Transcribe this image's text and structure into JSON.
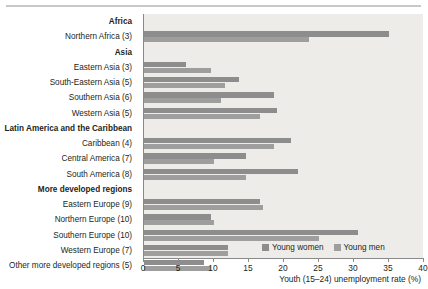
{
  "chart_data": {
    "type": "bar",
    "orientation": "horizontal",
    "title": "",
    "xlabel": "Youth (15–24) unemployment rate (%)",
    "ylabel": "",
    "xlim": [
      0,
      40
    ],
    "xticks": [
      0,
      5,
      10,
      15,
      20,
      25,
      30,
      35,
      40
    ],
    "grid": false,
    "legend_position": "bottom-right",
    "legend": [
      "Young women",
      "Young men"
    ],
    "colors": {
      "young_women": "#8d8d8d",
      "young_men": "#9e9e9e",
      "plot_background": "#eeece8",
      "axis": "#8a8a8a",
      "text": "#231f20"
    },
    "categories": [
      "Africa",
      "Northern Africa (3)",
      "Asia",
      "Eastern Asia (3)",
      "South-Eastern Asia (5)",
      "Southern Asia (6)",
      "Western Asia (5)",
      "Latin America and the Caribbean",
      "Caribbean (4)",
      "Central America (7)",
      "South America (8)",
      "More developed regions",
      "Eastern Europe (9)",
      "Northern Europe (10)",
      "Southern Europe (10)",
      "Western Europe (7)",
      "Other more developed regions (5)"
    ],
    "series": [
      {
        "name": "Young women",
        "values": [
          null,
          35.0,
          null,
          6.0,
          13.5,
          18.5,
          19.0,
          null,
          21.0,
          14.5,
          22.0,
          null,
          16.5,
          9.5,
          30.5,
          12.0,
          8.5
        ]
      },
      {
        "name": "Young men",
        "values": [
          null,
          23.5,
          null,
          9.5,
          11.5,
          11.0,
          16.5,
          null,
          18.5,
          10.0,
          14.5,
          null,
          17.0,
          10.0,
          25.0,
          12.0,
          9.5
        ]
      }
    ],
    "rows": [
      {
        "label": "Africa",
        "header": true,
        "women": null,
        "men": null
      },
      {
        "label": "Northern Africa (3)",
        "header": false,
        "women": 35.0,
        "men": 23.5
      },
      {
        "label": "Asia",
        "header": true,
        "women": null,
        "men": null
      },
      {
        "label": "Eastern Asia (3)",
        "header": false,
        "women": 6.0,
        "men": 9.5
      },
      {
        "label": "South-Eastern Asia (5)",
        "header": false,
        "women": 13.5,
        "men": 11.5
      },
      {
        "label": "Southern Asia (6)",
        "header": false,
        "women": 18.5,
        "men": 11.0
      },
      {
        "label": "Western Asia (5)",
        "header": false,
        "women": 19.0,
        "men": 16.5
      },
      {
        "label": "Latin America and the Caribbean",
        "header": true,
        "women": null,
        "men": null
      },
      {
        "label": "Caribbean (4)",
        "header": false,
        "women": 21.0,
        "men": 18.5
      },
      {
        "label": "Central America (7)",
        "header": false,
        "women": 14.5,
        "men": 10.0
      },
      {
        "label": "South America (8)",
        "header": false,
        "women": 22.0,
        "men": 14.5
      },
      {
        "label": "More developed regions",
        "header": true,
        "women": null,
        "men": null
      },
      {
        "label": "Eastern Europe (9)",
        "header": false,
        "women": 16.5,
        "men": 17.0
      },
      {
        "label": "Northern Europe (10)",
        "header": false,
        "women": 9.5,
        "men": 10.0
      },
      {
        "label": "Southern Europe (10)",
        "header": false,
        "women": 30.5,
        "men": 25.0
      },
      {
        "label": "Western Europe (7)",
        "header": false,
        "women": 12.0,
        "men": 12.0
      },
      {
        "label": "Other more developed regions (5)",
        "header": false,
        "women": 8.5,
        "men": 9.5
      }
    ]
  }
}
